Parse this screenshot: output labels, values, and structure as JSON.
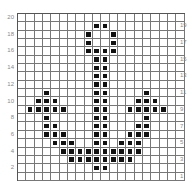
{
  "grid": {
    "columns": 20,
    "rows": 20,
    "fill_color": "#111111",
    "line_color": "#777777"
  },
  "row_labels_left": [
    "20",
    "18",
    "16",
    "14",
    "12",
    "10",
    "8",
    "6",
    "4",
    "2"
  ],
  "row_labels_right": [
    "19",
    "17",
    "15",
    "13",
    "11",
    "9",
    "7",
    "5",
    "3",
    "1"
  ],
  "filled_cells": [
    [
      1,
      9
    ],
    [
      1,
      10
    ],
    [
      2,
      8
    ],
    [
      2,
      11
    ],
    [
      3,
      8
    ],
    [
      3,
      11
    ],
    [
      4,
      8
    ],
    [
      4,
      9
    ],
    [
      4,
      10
    ],
    [
      4,
      11
    ],
    [
      5,
      9
    ],
    [
      5,
      10
    ],
    [
      6,
      9
    ],
    [
      6,
      10
    ],
    [
      7,
      9
    ],
    [
      7,
      10
    ],
    [
      8,
      9
    ],
    [
      8,
      10
    ],
    [
      9,
      3
    ],
    [
      9,
      9
    ],
    [
      9,
      10
    ],
    [
      9,
      15
    ],
    [
      10,
      2
    ],
    [
      10,
      3
    ],
    [
      10,
      4
    ],
    [
      10,
      9
    ],
    [
      10,
      10
    ],
    [
      10,
      14
    ],
    [
      10,
      15
    ],
    [
      10,
      16
    ],
    [
      11,
      1
    ],
    [
      11,
      2
    ],
    [
      11,
      3
    ],
    [
      11,
      4
    ],
    [
      11,
      5
    ],
    [
      11,
      9
    ],
    [
      11,
      10
    ],
    [
      11,
      13
    ],
    [
      11,
      14
    ],
    [
      11,
      15
    ],
    [
      11,
      16
    ],
    [
      11,
      17
    ],
    [
      12,
      3
    ],
    [
      12,
      9
    ],
    [
      12,
      10
    ],
    [
      12,
      15
    ],
    [
      13,
      3
    ],
    [
      13,
      4
    ],
    [
      13,
      9
    ],
    [
      13,
      10
    ],
    [
      13,
      14
    ],
    [
      13,
      15
    ],
    [
      14,
      3
    ],
    [
      14,
      4
    ],
    [
      14,
      5
    ],
    [
      14,
      9
    ],
    [
      14,
      10
    ],
    [
      14,
      13
    ],
    [
      14,
      14
    ],
    [
      14,
      15
    ],
    [
      15,
      4
    ],
    [
      15,
      5
    ],
    [
      15,
      6
    ],
    [
      15,
      9
    ],
    [
      15,
      10
    ],
    [
      15,
      12
    ],
    [
      15,
      13
    ],
    [
      15,
      14
    ],
    [
      16,
      5
    ],
    [
      16,
      6
    ],
    [
      16,
      7
    ],
    [
      16,
      8
    ],
    [
      16,
      9
    ],
    [
      16,
      10
    ],
    [
      16,
      11
    ],
    [
      16,
      12
    ],
    [
      16,
      13
    ],
    [
      16,
      14
    ],
    [
      17,
      6
    ],
    [
      17,
      7
    ],
    [
      17,
      8
    ],
    [
      17,
      9
    ],
    [
      17,
      10
    ],
    [
      17,
      11
    ],
    [
      17,
      12
    ],
    [
      17,
      13
    ],
    [
      18,
      9
    ],
    [
      18,
      10
    ]
  ]
}
